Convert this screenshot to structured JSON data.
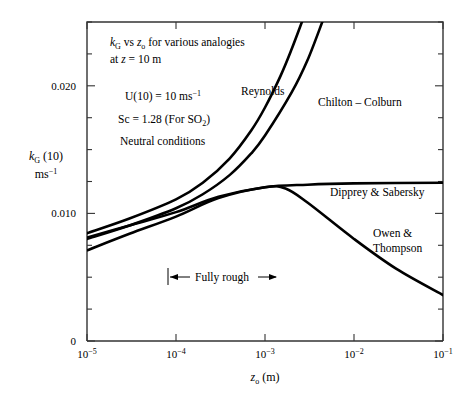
{
  "chart_data": {
    "type": "line",
    "title": "",
    "xlabel": "z_o (m)",
    "ylabel": "k_G (10) ms^-1",
    "xscale": "log",
    "yscale": "linear",
    "xlim": [
      1e-05,
      0.1
    ],
    "ylim": [
      0,
      0.025
    ],
    "xticks": [
      "10-5",
      "10-4",
      "10-3",
      "10-2",
      "10-1"
    ],
    "xtick_values": [
      1e-05,
      0.0001,
      0.001,
      0.01,
      0.1
    ],
    "yticks_labeled": [
      "0",
      "0.010",
      "0.020"
    ],
    "ytick_values_labeled": [
      0,
      0.01,
      0.02
    ],
    "ytick_minor_step": 0.0025,
    "grid": false,
    "legend": "inline-annotations",
    "series": [
      {
        "name": "Reynolds",
        "points": [
          [
            1e-05,
            0.00845
          ],
          [
            3e-05,
            0.0096
          ],
          [
            0.0001,
            0.0111
          ],
          [
            0.0002,
            0.0124
          ],
          [
            0.0004,
            0.0143
          ],
          [
            0.0007,
            0.0165
          ],
          [
            0.001,
            0.0183
          ],
          [
            0.0015,
            0.0208
          ],
          [
            0.002,
            0.0229
          ],
          [
            0.0026,
            0.025
          ]
        ]
      },
      {
        "name": "Chilton – Colburn",
        "points": [
          [
            1e-05,
            0.008
          ],
          [
            3e-05,
            0.00905
          ],
          [
            0.0001,
            0.0104
          ],
          [
            0.0002,
            0.0115
          ],
          [
            0.0004,
            0.013
          ],
          [
            0.0007,
            0.0147
          ],
          [
            0.001,
            0.0161
          ],
          [
            0.002,
            0.0195
          ],
          [
            0.003,
            0.022
          ],
          [
            0.0044,
            0.025
          ]
        ]
      },
      {
        "name": "Dipprey & Sabersky",
        "points": [
          [
            1e-05,
            0.0081
          ],
          [
            3e-05,
            0.00905
          ],
          [
            0.0001,
            0.0101
          ],
          [
            0.0003,
            0.0113
          ],
          [
            0.001,
            0.01205
          ],
          [
            0.003,
            0.01225
          ],
          [
            0.01,
            0.01235
          ],
          [
            0.1,
            0.0124
          ]
        ]
      },
      {
        "name": "Owen & Thompson",
        "points": [
          [
            1e-05,
            0.0071
          ],
          [
            3e-05,
            0.0084
          ],
          [
            0.0001,
            0.00975
          ],
          [
            0.0003,
            0.0112
          ],
          [
            0.001,
            0.01205
          ],
          [
            0.0017,
            0.01195
          ],
          [
            0.003,
            0.01085
          ],
          [
            0.01,
            0.008
          ],
          [
            0.03,
            0.00565
          ],
          [
            0.1,
            0.0036
          ]
        ]
      }
    ],
    "annotations": [
      {
        "name": "fully-rough",
        "text": "Fully rough",
        "x_range": [
          8e-05,
          0.0025
        ],
        "y": 0.00435
      }
    ],
    "notes": [
      "kG vs zo  for various analogies",
      "at z = 10 m",
      "U(10) = 10 ms-1",
      "Sc = 1.28 (For SO2)",
      "Neutral conditions"
    ]
  },
  "axes": {
    "x_tick_labels": [
      {
        "mantissa": "10",
        "exponent": "-5"
      },
      {
        "mantissa": "10",
        "exponent": "-4"
      },
      {
        "mantissa": "10",
        "exponent": "-3"
      },
      {
        "mantissa": "10",
        "exponent": "-2"
      },
      {
        "mantissa": "10",
        "exponent": "-1"
      }
    ],
    "y_tick_labels": [
      {
        "value": 0,
        "text": "0"
      },
      {
        "value": 0.01,
        "text": "0.010"
      },
      {
        "value": 0.02,
        "text": "0.020"
      }
    ],
    "x_axis_title": {
      "var": "z",
      "sub": "o",
      "rest": " (m)"
    },
    "y_axis_title_line1": {
      "var": "k",
      "sub": "G",
      "rest": " (10)"
    },
    "y_axis_title_line2": {
      "base": "ms",
      "sup": "−1"
    }
  },
  "notes_block": {
    "line1": {
      "var1": "k",
      "sub1": "G",
      "mid": " vs ",
      "var2": "z",
      "sub2": "o",
      "rest": "  for various analogies"
    },
    "line2": {
      "pre": "at ",
      "var": "z",
      "rest": " = 10 m"
    },
    "line3": {
      "base": "U(10) = 10 ms",
      "sup": "−1"
    },
    "line4": {
      "pre": "Sc = 1.28 (For SO",
      "sub": "2",
      "post": ")"
    },
    "line5": "Neutral conditions"
  },
  "curve_labels": {
    "reynolds": "Reynolds",
    "chilton_colburn": "Chilton – Colburn",
    "dipprey_sabersky": "Dipprey & Sabersky",
    "owen_thompson_line1": "Owen &",
    "owen_thompson_line2": "Thompson"
  },
  "annotation_labels": {
    "fully_rough": "Fully rough"
  },
  "colors": {
    "background": "#ffffff",
    "curve": "#000000",
    "axis": "#333333",
    "text": "#000000"
  }
}
